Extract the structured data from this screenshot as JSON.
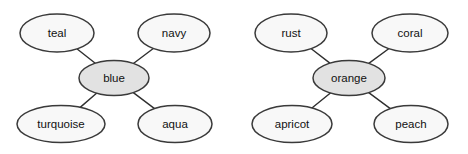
{
  "diagram": {
    "type": "node-link-graph",
    "background_color": "#ffffff",
    "node_fill_center": "#e2e2e2",
    "node_fill_leaf": "#f8f8f8",
    "node_stroke": "#3a3a3a",
    "edge_stroke": "#2f2f2f",
    "label_color": "#111111",
    "clusters": [
      {
        "id": "blue-cluster",
        "center": {
          "id": "blue",
          "label": "blue",
          "cx": 114,
          "cy": 78,
          "rx": 35,
          "ry": 17.5,
          "role": "center"
        },
        "leaves": [
          {
            "id": "teal",
            "label": "teal",
            "cx": 57,
            "cy": 33,
            "rx": 37,
            "ry": 19,
            "role": "leaf"
          },
          {
            "id": "navy",
            "label": "navy",
            "cx": 174,
            "cy": 33,
            "rx": 36,
            "ry": 19,
            "role": "leaf"
          },
          {
            "id": "turquoise",
            "label": "turquoise",
            "cx": 61,
            "cy": 124,
            "rx": 44,
            "ry": 18.5,
            "role": "leaf"
          },
          {
            "id": "aqua",
            "label": "aqua",
            "cx": 175,
            "cy": 124,
            "rx": 37,
            "ry": 18.5,
            "role": "leaf"
          }
        ],
        "edges": [
          {
            "from": "blue",
            "to": "teal"
          },
          {
            "from": "blue",
            "to": "navy"
          },
          {
            "from": "blue",
            "to": "turquoise"
          },
          {
            "from": "blue",
            "to": "aqua"
          }
        ]
      },
      {
        "id": "orange-cluster",
        "center": {
          "id": "orange",
          "label": "orange",
          "cx": 349,
          "cy": 78,
          "rx": 36,
          "ry": 17.5,
          "role": "center"
        },
        "leaves": [
          {
            "id": "rust",
            "label": "rust",
            "cx": 291,
            "cy": 33,
            "rx": 36,
            "ry": 19,
            "role": "leaf"
          },
          {
            "id": "coral",
            "label": "coral",
            "cx": 410,
            "cy": 33,
            "rx": 38,
            "ry": 19,
            "role": "leaf"
          },
          {
            "id": "apricot",
            "label": "apricot",
            "cx": 292,
            "cy": 124,
            "rx": 40,
            "ry": 18.5,
            "role": "leaf"
          },
          {
            "id": "peach",
            "label": "peach",
            "cx": 411,
            "cy": 124,
            "rx": 37,
            "ry": 18.5,
            "role": "leaf"
          }
        ],
        "edges": [
          {
            "from": "orange",
            "to": "rust"
          },
          {
            "from": "orange",
            "to": "coral"
          },
          {
            "from": "orange",
            "to": "apricot"
          },
          {
            "from": "orange",
            "to": "peach"
          }
        ]
      }
    ]
  }
}
